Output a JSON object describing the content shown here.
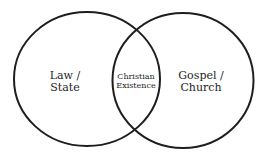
{
  "diagram": {
    "type": "venn",
    "stroke_color": "#1e1e1e",
    "background": "#ffffff",
    "sets": [
      {
        "id": "left",
        "lines": [
          "Law /",
          "State"
        ]
      },
      {
        "id": "right",
        "lines": [
          "Gospel /",
          "Church"
        ]
      }
    ],
    "intersection": {
      "lines": [
        "Christian",
        "Existence"
      ]
    }
  }
}
